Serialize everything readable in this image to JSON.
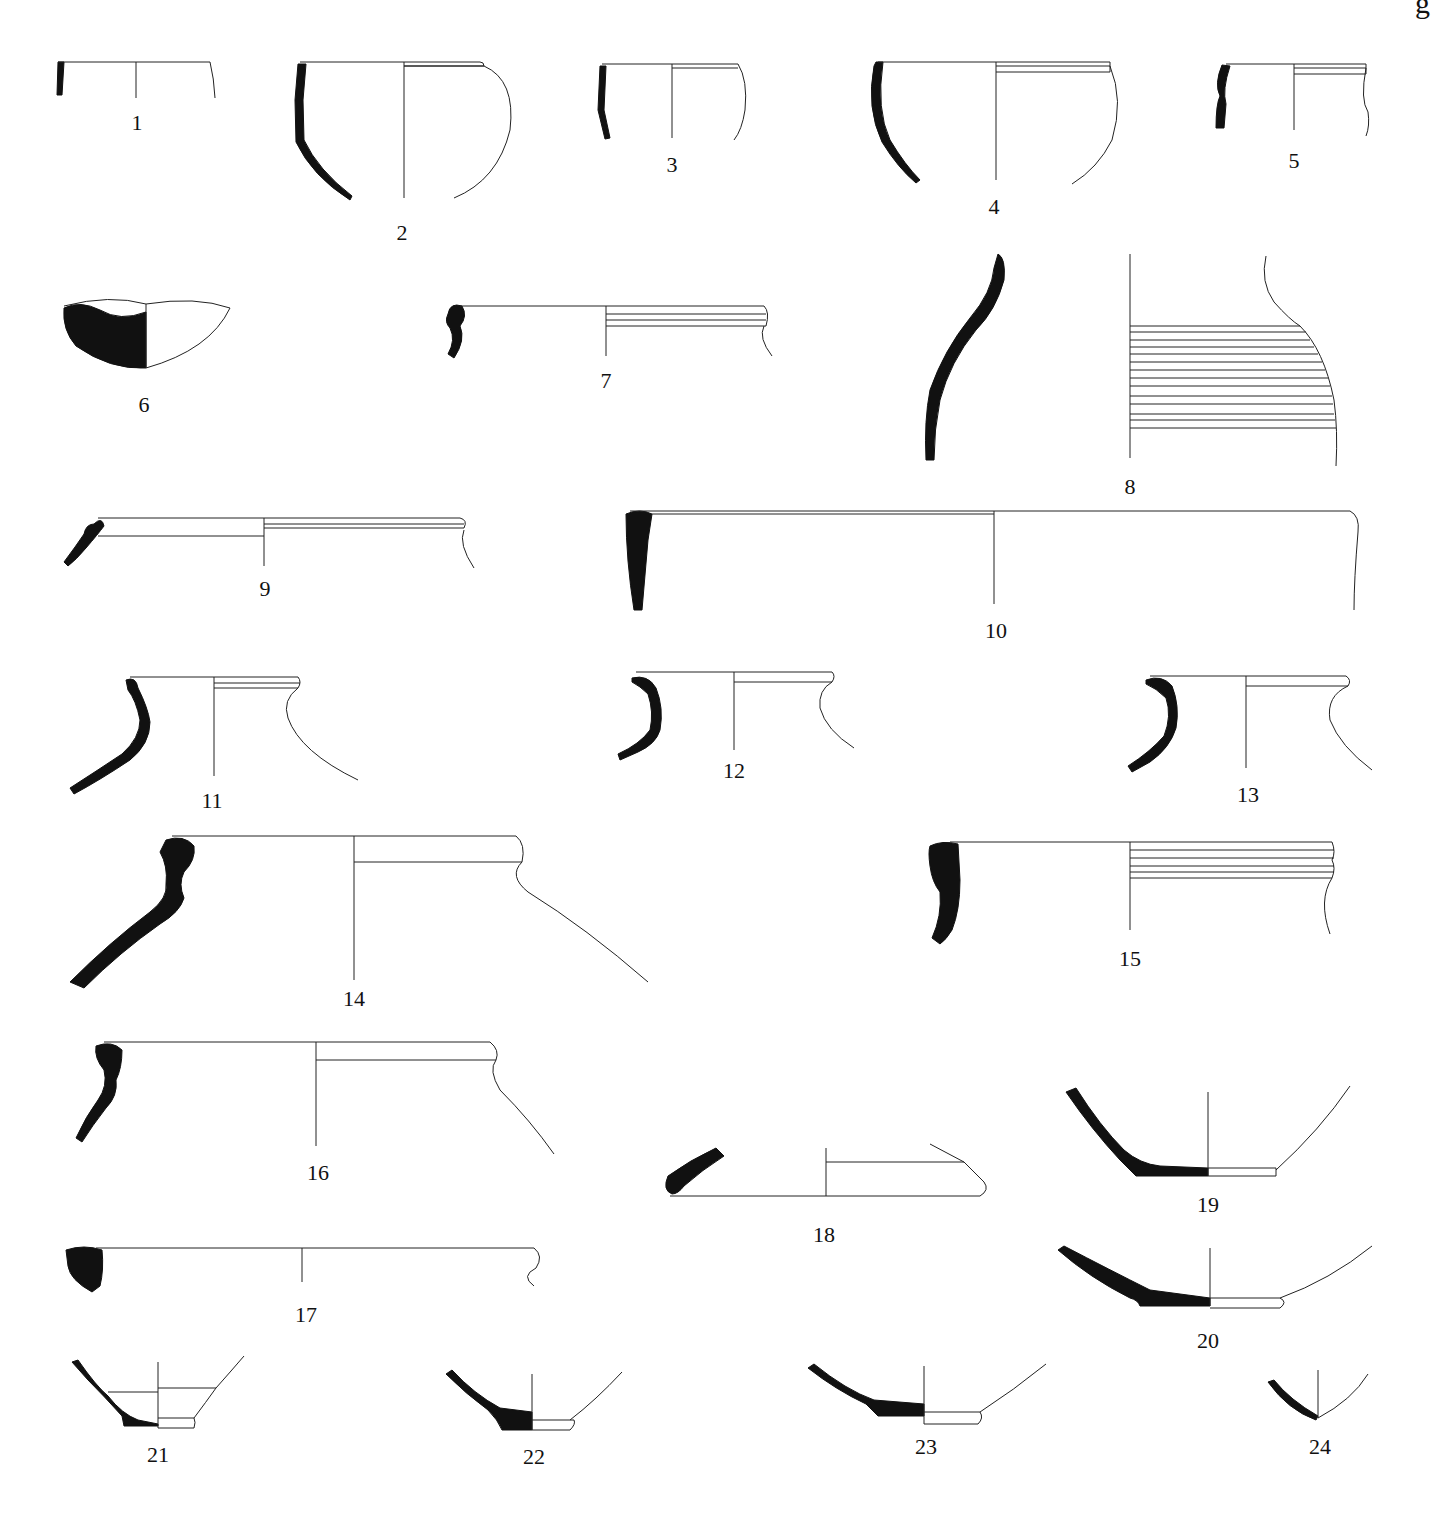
{
  "page": {
    "corner_fragment": "g"
  },
  "figure": {
    "type": "pottery profile plate",
    "drawings": [
      {
        "id": 1,
        "label": "1"
      },
      {
        "id": 2,
        "label": "2"
      },
      {
        "id": 3,
        "label": "3"
      },
      {
        "id": 4,
        "label": "4"
      },
      {
        "id": 5,
        "label": "5"
      },
      {
        "id": 6,
        "label": "6"
      },
      {
        "id": 7,
        "label": "7"
      },
      {
        "id": 8,
        "label": "8"
      },
      {
        "id": 9,
        "label": "9"
      },
      {
        "id": 10,
        "label": "10"
      },
      {
        "id": 11,
        "label": "11"
      },
      {
        "id": 12,
        "label": "12"
      },
      {
        "id": 13,
        "label": "13"
      },
      {
        "id": 14,
        "label": "14"
      },
      {
        "id": 15,
        "label": "15"
      },
      {
        "id": 16,
        "label": "16"
      },
      {
        "id": 17,
        "label": "17"
      },
      {
        "id": 18,
        "label": "18"
      },
      {
        "id": 19,
        "label": "19"
      },
      {
        "id": 20,
        "label": "20"
      },
      {
        "id": 21,
        "label": "21"
      },
      {
        "id": 22,
        "label": "22"
      },
      {
        "id": 23,
        "label": "23"
      },
      {
        "id": 24,
        "label": "24"
      }
    ]
  },
  "colors": {
    "section_fill": "#111111",
    "line": "#222222",
    "background": "#ffffff"
  }
}
